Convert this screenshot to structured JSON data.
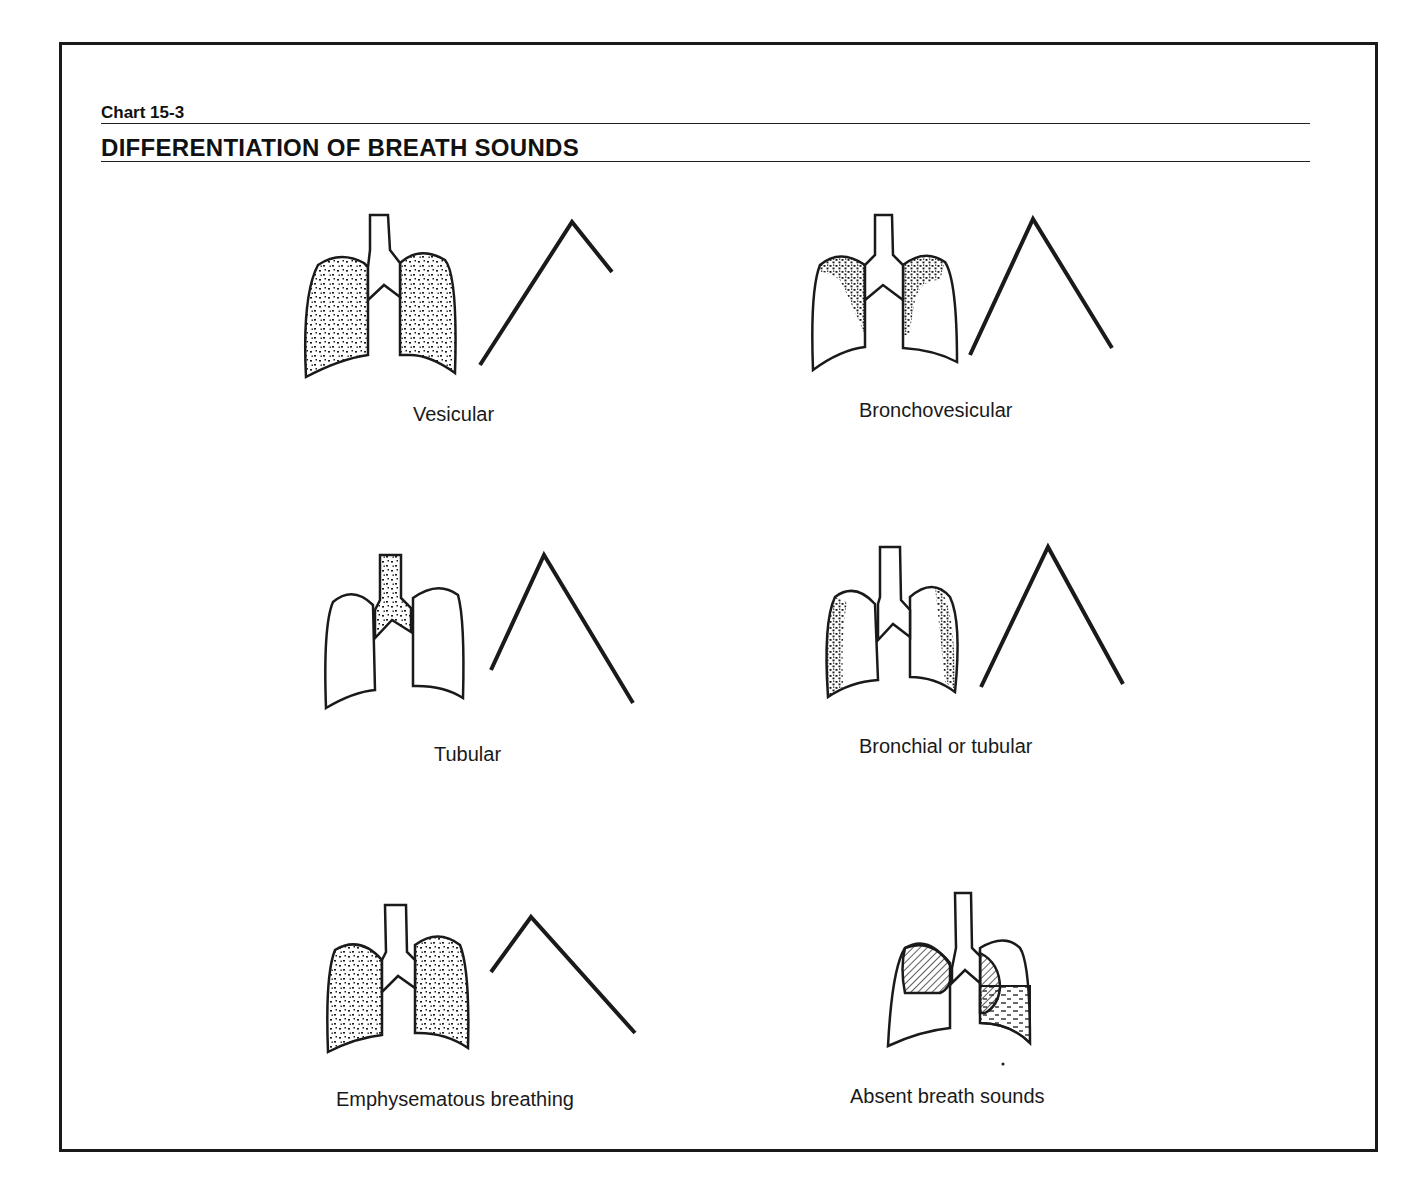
{
  "header": {
    "chart_number": "Chart 15-3",
    "title": "DIFFERENTIATION OF BREATH SOUNDS"
  },
  "panels": [
    {
      "label": "Vesicular",
      "lung_shading": "diffuse stipple both lungs",
      "waveform": "long inspiration, short expiration"
    },
    {
      "label": "Bronchovesicular",
      "lung_shading": "stipple along upper/medial lungs",
      "waveform": "equal inspiration and expiration"
    },
    {
      "label": "Tubular",
      "lung_shading": "stipple in trachea only",
      "waveform": "short inspiration, long expiration"
    },
    {
      "label": "Bronchial or tubular",
      "lung_shading": "stipple along lateral lungs",
      "waveform": "equal inspiration and expiration"
    },
    {
      "label": "Emphysematous breathing",
      "lung_shading": "diffuse stipple both lungs",
      "waveform": "short inspiration, prolonged expiration"
    },
    {
      "label": "Absent breath sounds",
      "lung_shading": "hatched upper lobes, fluid in left base",
      "waveform": "none"
    }
  ],
  "colors": {
    "ink": "#1a1a1a",
    "background": "#ffffff"
  }
}
